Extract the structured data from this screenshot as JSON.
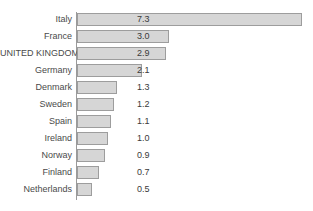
{
  "chart_data": {
    "type": "bar",
    "orientation": "horizontal",
    "title": "",
    "xlabel": "",
    "ylabel": "",
    "grid": false,
    "legend": null,
    "xlim": [
      0,
      7.6
    ],
    "categories": [
      "Italy",
      "France",
      "UNITED KINGDOM",
      "Germany",
      "Denmark",
      "Sweden",
      "Spain",
      "Ireland",
      "Norway",
      "Finland",
      "Netherlands"
    ],
    "values": [
      7.3,
      3.0,
      2.9,
      2.1,
      1.3,
      1.2,
      1.1,
      1.0,
      0.9,
      0.7,
      0.5
    ],
    "value_labels": [
      "7.3",
      "3.0",
      "2.9",
      "2.1",
      "1.3",
      "1.2",
      "1.1",
      "1.0",
      "0.9",
      "0.7",
      "0.5"
    ],
    "bar_color": "#d6d6d6",
    "bar_border_color": "#9d9d9d",
    "axis_color": "#9a9a9a",
    "text_color": "#3a3a3a",
    "background": "#ffffff"
  }
}
